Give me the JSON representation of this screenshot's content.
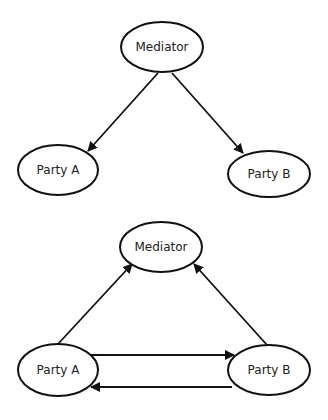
{
  "diagram": {
    "title": "",
    "colors": {
      "stroke": "#111111",
      "fill": "#ffffff",
      "text": "#222222"
    },
    "panels": [
      {
        "name": "top-diagram",
        "nodes": [
          {
            "id": "mediator",
            "label": "Mediator",
            "cx": 162,
            "cy": 47,
            "rx": 41,
            "ry": 25
          },
          {
            "id": "party-a",
            "label": "Party A",
            "cx": 58,
            "cy": 170,
            "rx": 40,
            "ry": 25
          },
          {
            "id": "party-b",
            "label": "Party B",
            "cx": 269,
            "cy": 174,
            "rx": 41,
            "ry": 23
          }
        ],
        "edges": [
          {
            "from": "Mediator",
            "to": "Party A",
            "x1": 158,
            "y1": 73,
            "x2": 88,
            "y2": 151
          },
          {
            "from": "Mediator",
            "to": "Party B",
            "x1": 172,
            "y1": 73,
            "x2": 243,
            "y2": 153
          }
        ]
      },
      {
        "name": "bottom-diagram",
        "nodes": [
          {
            "id": "mediator",
            "label": "Mediator",
            "cx": 161,
            "cy": 247,
            "rx": 41,
            "ry": 25
          },
          {
            "id": "party-a",
            "label": "Party A",
            "cx": 58,
            "cy": 370,
            "rx": 40,
            "ry": 26
          },
          {
            "id": "party-b",
            "label": "Party B",
            "cx": 269,
            "cy": 370,
            "rx": 41,
            "ry": 25
          }
        ],
        "edges": [
          {
            "from": "Party A",
            "to": "Mediator",
            "x1": 58,
            "y1": 344,
            "x2": 132,
            "y2": 264
          },
          {
            "from": "Party B",
            "to": "Mediator",
            "x1": 267,
            "y1": 345,
            "x2": 194,
            "y2": 264
          },
          {
            "from": "Party A",
            "to": "Party B",
            "x1": 91,
            "y1": 355,
            "x2": 234,
            "y2": 355
          },
          {
            "from": "Party B",
            "to": "Party A",
            "x1": 232,
            "y1": 387,
            "x2": 91,
            "y2": 387
          }
        ]
      }
    ]
  }
}
